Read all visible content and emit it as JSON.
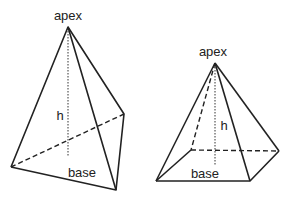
{
  "diagram": {
    "type": "geometry",
    "figures": [
      {
        "name": "triangular-pyramid",
        "labels": {
          "apex": "apex",
          "height": "h",
          "base": "base"
        }
      },
      {
        "name": "square-pyramid",
        "labels": {
          "apex": "apex",
          "height": "h",
          "base": "base"
        }
      }
    ],
    "colors": {
      "line": "#222222",
      "background": "#ffffff"
    }
  }
}
